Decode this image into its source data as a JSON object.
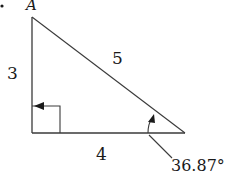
{
  "diagram": {
    "type": "right-triangle",
    "bullet": "•",
    "vertex_label": "A",
    "sides": {
      "vertical": "3",
      "hypotenuse": "5",
      "horizontal": "4"
    },
    "angle_label": "36.87°",
    "colors": {
      "stroke": "#3a3a3a",
      "text": "#1a1a1a",
      "background": "#ffffff"
    }
  }
}
